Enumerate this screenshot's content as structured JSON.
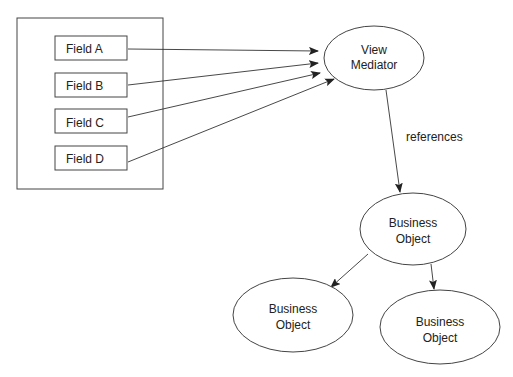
{
  "diagram": {
    "container": {
      "label": ""
    },
    "fields": [
      {
        "label": "Field A"
      },
      {
        "label": "Field B"
      },
      {
        "label": "Field C"
      },
      {
        "label": "Field D"
      }
    ],
    "view_mediator": {
      "line1": "View",
      "line2": "Mediator"
    },
    "edge_label": "references",
    "business_objects": [
      {
        "line1": "Business",
        "line2": "Object"
      },
      {
        "line1": "Business",
        "line2": "Object"
      },
      {
        "line1": "Business",
        "line2": "Object"
      }
    ],
    "colors": {
      "stroke": "#444444",
      "text": "#222222",
      "background": "#ffffff"
    }
  }
}
